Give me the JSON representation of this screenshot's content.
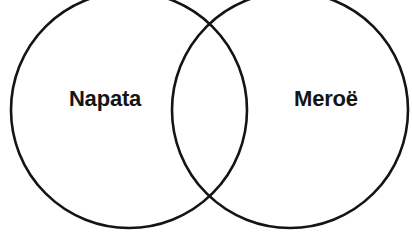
{
  "diagram": {
    "type": "venn-2-set",
    "background_color": "#ffffff",
    "stroke_color": "#141414",
    "stroke_width": 2.6,
    "text_color": "#151515",
    "left_set": {
      "label": "Napata",
      "center_x": 129,
      "center_y": 110,
      "radius": 118,
      "label_x": 105,
      "label_y": 99
    },
    "right_set": {
      "label": "Meroë",
      "center_x": 290,
      "center_y": 110,
      "radius": 118,
      "label_x": 326,
      "label_y": 99
    },
    "intersection": {
      "label": "",
      "upper_crossing_x": 210,
      "upper_crossing_y": 13,
      "lower_crossing_x": 210,
      "lower_crossing_y": 198
    }
  }
}
